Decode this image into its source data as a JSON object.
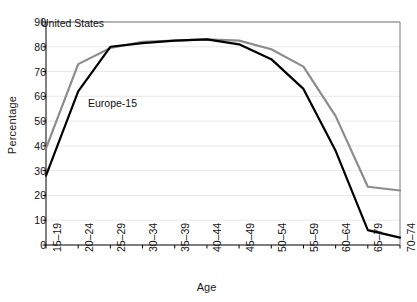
{
  "chart_data": {
    "type": "line",
    "title": "",
    "xlabel": "Age",
    "ylabel": "Percentage",
    "ylim": [
      0,
      90
    ],
    "ytick_step": 10,
    "yticks": [
      "0",
      "10",
      "20",
      "30",
      "40",
      "50",
      "60",
      "70",
      "80",
      "90"
    ],
    "grid": true,
    "legend_position": "inline-annotations",
    "categories": [
      "15–19",
      "20–24",
      "25–29",
      "30–34",
      "35–39",
      "40–44",
      "45–49",
      "50–54",
      "55–59",
      "60–64",
      "65–79",
      "70–74"
    ],
    "series": [
      {
        "name": "United States",
        "color": "#8c8c8c",
        "values": [
          39,
          73,
          79.5,
          82,
          82.5,
          83,
          82.5,
          79,
          72,
          52,
          23.5,
          22
        ]
      },
      {
        "name": "Europe-15",
        "color": "#000000",
        "values": [
          28,
          62,
          80,
          81.5,
          82.5,
          83,
          81,
          75,
          63,
          38,
          6,
          3
        ]
      }
    ],
    "annotations": [
      {
        "text": "United States",
        "series": "United States"
      },
      {
        "text": "Europe-15",
        "series": "Europe-15"
      }
    ]
  },
  "axes": {
    "x_title": "Age",
    "y_title": "Percentage"
  }
}
